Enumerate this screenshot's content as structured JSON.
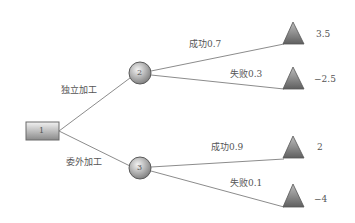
{
  "decision_node": {
    "label": "1"
  },
  "chance_nodes": [
    {
      "label": "2",
      "branch_label": "独立加工"
    },
    {
      "label": "3",
      "branch_label": "委外加工"
    }
  ],
  "outcomes": [
    {
      "label": "成功0.7",
      "value": "3.5"
    },
    {
      "label": "失败0.3",
      "value": "−2.5"
    },
    {
      "label": "成功0.9",
      "value": "2"
    },
    {
      "label": "失败0.1",
      "value": "−4"
    }
  ]
}
